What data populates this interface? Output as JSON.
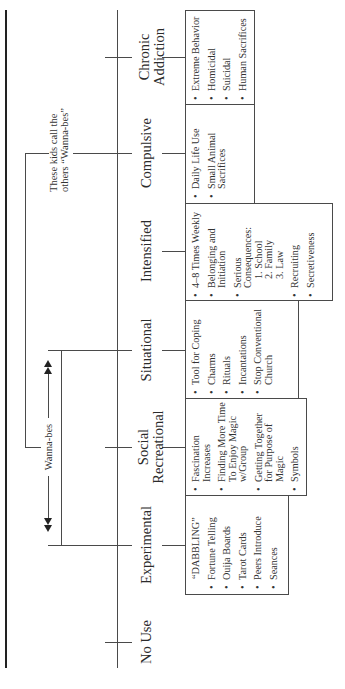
{
  "diagram": {
    "stages": [
      {
        "id": "chronic",
        "label": "Chronic\nAddiction",
        "items": [
          "Extreme Behavior",
          "Homicidal",
          "Suicidal",
          "Human Sacrifices"
        ]
      },
      {
        "id": "compulsive",
        "label": "Compulsive",
        "items": [
          "Daily Life Use",
          "Small Animal\nSacrifices"
        ]
      },
      {
        "id": "intensified",
        "label": "Intensified",
        "items": [
          "4–8 Times Weekly",
          "Belonging and\nInitiation",
          "Serious\nConsequences:",
          "1. School",
          "2. Family",
          "3. Law",
          "Recruiting",
          "Secretiveness"
        ]
      },
      {
        "id": "situational",
        "label": "Situational",
        "items": [
          "Tool for Coping",
          "Charms",
          "Rituals",
          "Incantations",
          "Stop Conventional\nChurch"
        ]
      },
      {
        "id": "social",
        "label": "Social\nRecreational",
        "items": [
          "Fascination\nIncreases",
          "Finding More Time\nTo Enjoy Magic\nw/Group",
          "Getting Together\nfor Purpose of\nMagic",
          "Symbols"
        ]
      },
      {
        "id": "experimental",
        "label": "Experimental",
        "header": "“DABBLING”",
        "items": [
          "Fortune Telling",
          "Ouija Boards",
          "Tarot Cards",
          "Peers Introduce",
          "Seances"
        ]
      },
      {
        "id": "nouse",
        "label": "No Use",
        "items": []
      }
    ],
    "annotations": {
      "top_bracket_note": "These kids call the\nothers “Wanna-bes”",
      "wannabes_label": "Wanna-bes"
    },
    "colors": {
      "line": "#4a4a4a",
      "thick_line": "#222222",
      "text": "#2b2b2b",
      "background": "#ffffff"
    }
  }
}
